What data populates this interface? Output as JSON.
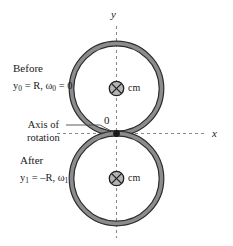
{
  "figure": {
    "axes": {
      "y_label": "y",
      "x_label": "x",
      "origin_label": "0"
    },
    "annotations": {
      "axis_of_rotation_line1": "Axis of",
      "axis_of_rotation_line2": "rotation"
    },
    "states": [
      {
        "id": "before",
        "name": "Before",
        "equation_html": "y<sub>0</sub> = R, ω<sub>0</sub> = 0",
        "equation_text": "y0 = R, ω0 = 0",
        "cm_label": "cm",
        "cm_symbol": "⊗"
      },
      {
        "id": "after",
        "name": "After",
        "equation_html": "y<sub>1</sub> = –R, ω<sub>1</sub>",
        "equation_text": "y1 = –R, ω1",
        "cm_label": "cm",
        "cm_symbol": "⊗"
      }
    ],
    "colors": {
      "ring_fill": "#8c8c8c",
      "ring_stroke": "#2b2b2b",
      "axis_dash": "#8a8a8a",
      "text": "#1a1a1a",
      "background": "#ffffff"
    }
  }
}
